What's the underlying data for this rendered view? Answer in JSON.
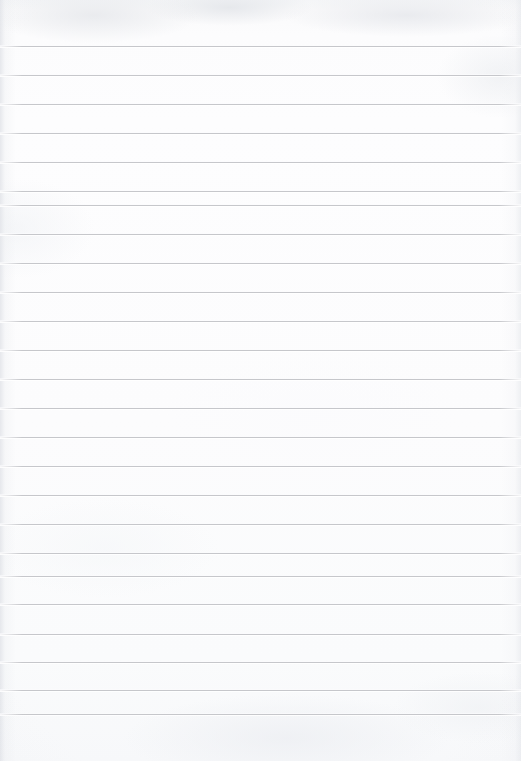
{
  "document": {
    "kind": "lined-notebook-paper-scan",
    "title": "",
    "page_label": "",
    "body_text": "",
    "is_blank": true,
    "orientation": "portrait",
    "width_px": 521,
    "height_px": 761
  },
  "ruling": {
    "line_count": 24,
    "first_line_y": 46,
    "line_spacing_px": 29.1,
    "line_thickness_px": 1,
    "line_color": "#c6c7cb",
    "margin_rule": "none",
    "left_inset_px": 0,
    "right_inset_px": 0,
    "line_y_positions": [
      46,
      75,
      104,
      133,
      162,
      191,
      205,
      234,
      263,
      292,
      321,
      350,
      379,
      408,
      437,
      466,
      495,
      524,
      553,
      576,
      604,
      634,
      662,
      690,
      714
    ]
  },
  "paper": {
    "background_color": "#fbfbfc",
    "top_shade_color": "#f4f5f7",
    "bottom_shade_color": "#f7f8fa",
    "edge_shade_color": "#e2e4e9",
    "top_margin_px": 46,
    "bottom_margin_px": 47
  },
  "annotations": {
    "handwriting": "none",
    "stamps": "none",
    "holes": "none"
  }
}
